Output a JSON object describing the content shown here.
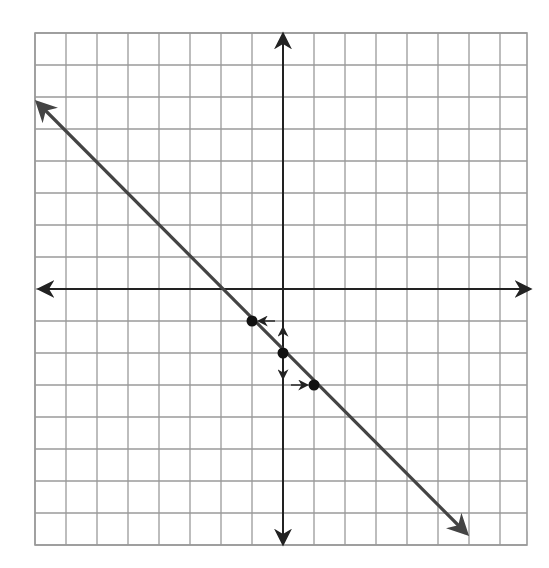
{
  "chart_data": {
    "type": "line",
    "title": "",
    "xlabel": "",
    "ylabel": "",
    "grid": true,
    "xlim": [
      -8,
      8
    ],
    "ylim": [
      -8,
      8
    ],
    "x_ticks_labeled": false,
    "y_ticks_labeled": false,
    "line": {
      "equation": "y = -x - 2",
      "slope": -1,
      "y_intercept": -2,
      "arrows_both_ends": true,
      "extent": {
        "from": [
          -8,
          6
        ],
        "to": [
          6,
          -8
        ]
      }
    },
    "points": [
      {
        "x": -1,
        "y": -1
      },
      {
        "x": 0,
        "y": -2
      },
      {
        "x": 1,
        "y": -3
      }
    ],
    "slope_arrows": [
      {
        "from": [
          0,
          -2
        ],
        "to": [
          0,
          -1
        ],
        "note": "rise +1 up from y-intercept"
      },
      {
        "from": [
          0,
          -1
        ],
        "to": [
          -1,
          -1
        ],
        "note": "run -1 left"
      },
      {
        "from": [
          0,
          -2
        ],
        "to": [
          0,
          -3
        ],
        "note": "rise -1 down from y-intercept"
      },
      {
        "from": [
          0,
          -3
        ],
        "to": [
          1,
          -3
        ],
        "note": "run +1 right"
      }
    ],
    "colors": {
      "grid": "#9a9a9a",
      "axes": "#222222",
      "line": "#444444",
      "points": "#111111"
    }
  }
}
